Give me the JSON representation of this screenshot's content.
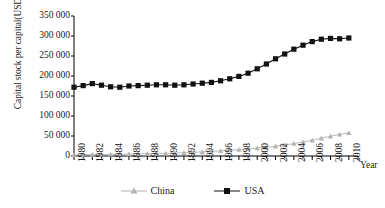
{
  "chart_data": {
    "type": "line",
    "title": "",
    "subtitle": "",
    "xlabel": "Year",
    "ylabel": "Capital stock per capital(USD)",
    "xlim": [
      1980,
      2011
    ],
    "ylim": [
      0,
      350000
    ],
    "ytick_labels": [
      "350 000",
      "300 000",
      "250 000",
      "200 000",
      "150 000",
      "100 000",
      "50 000",
      "0"
    ],
    "ytick_values": [
      350000,
      300000,
      250000,
      200000,
      150000,
      100000,
      50000,
      0
    ],
    "xtick_labels": [
      "1980",
      "1982",
      "1984",
      "1986",
      "1988",
      "1990",
      "1992",
      "1994",
      "1996",
      "1998",
      "2000",
      "2002",
      "2004",
      "2006",
      "2008",
      "2010"
    ],
    "xtick_values": [
      1980,
      1982,
      1984,
      1986,
      1988,
      1990,
      1992,
      1994,
      1996,
      1998,
      2000,
      2002,
      2004,
      2006,
      2008,
      2010
    ],
    "grid": false,
    "legend_position": "bottom",
    "x": [
      1980,
      1981,
      1982,
      1983,
      1984,
      1985,
      1986,
      1987,
      1988,
      1989,
      1990,
      1991,
      1992,
      1993,
      1994,
      1995,
      1996,
      1997,
      1998,
      1999,
      2000,
      2001,
      2002,
      2003,
      2004,
      2005,
      2006,
      2007,
      2008,
      2009,
      2010
    ],
    "series": [
      {
        "name": "China",
        "color": "#b3b3b3",
        "marker": "triangle",
        "values": [
          3000,
          3200,
          3500,
          3800,
          4200,
          4600,
          5000,
          5500,
          6000,
          6400,
          6800,
          7400,
          8200,
          9200,
          10200,
          11500,
          13000,
          14500,
          16000,
          17800,
          19800,
          22000,
          24500,
          27500,
          31000,
          35000,
          39500,
          44500,
          49500,
          54000,
          58000
        ]
      },
      {
        "name": "USA",
        "color": "#111111",
        "marker": "square",
        "values": [
          172000,
          176000,
          181000,
          177000,
          173000,
          172000,
          175000,
          176000,
          177000,
          178000,
          178000,
          177000,
          178000,
          180000,
          182000,
          184000,
          188000,
          193000,
          199000,
          207000,
          218000,
          230000,
          243000,
          255000,
          267000,
          277000,
          286000,
          292000,
          294000,
          293000,
          295000
        ]
      }
    ],
    "legend": [
      {
        "label": "China",
        "color": "#b3b3b3",
        "marker": "triangle"
      },
      {
        "label": "USA",
        "color": "#111111",
        "marker": "square"
      }
    ]
  }
}
